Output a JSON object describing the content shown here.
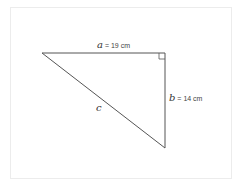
{
  "figure": {
    "type": "right-triangle",
    "sides": {
      "a": {
        "variable": "a",
        "equals": " = ",
        "value": "19 cm"
      },
      "b": {
        "variable": "b",
        "equals": " = ",
        "value": "14 cm"
      },
      "c": {
        "variable": "c",
        "value": ""
      }
    },
    "right_angle_marker": true,
    "colors": {
      "stroke": "#555555",
      "frame": "#ececec"
    }
  }
}
